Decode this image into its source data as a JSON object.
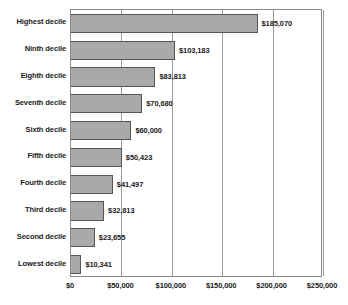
{
  "chart_data": {
    "type": "bar",
    "orientation": "horizontal",
    "title": "",
    "subtitle": "",
    "xlabel": "",
    "ylabel": "",
    "xlim": [
      0,
      250000
    ],
    "grid": true,
    "legend": null,
    "categories": [
      "Highest decile",
      "Ninth decile",
      "Eighth decile",
      "Seventh decile",
      "Sixth decile",
      "Fifth decile",
      "Fourth decile",
      "Third decile",
      "Second decile",
      "Lowest decile"
    ],
    "values": [
      185070,
      103183,
      83813,
      70680,
      60000,
      50423,
      41497,
      32813,
      23655,
      10341
    ],
    "data_labels": [
      "$185,070",
      "$103,183",
      "$83,813",
      "$70,680",
      "$60,000",
      "$50,423",
      "$41,497",
      "$32,813",
      "$23,655",
      "$10,341"
    ],
    "xticks": [
      0,
      50000,
      100000,
      150000,
      200000,
      250000
    ],
    "xtick_labels": [
      "$0",
      "$50,000",
      "$100,000",
      "$150,000",
      "$200,000",
      "$250,000"
    ],
    "colors": {
      "bar_fill": "#a9a9a9",
      "bar_stroke": "#555555",
      "gridline": "#9a9a9a",
      "axis": "#8a8a8a",
      "text": "#1a1a1a",
      "background": "#ffffff"
    }
  }
}
